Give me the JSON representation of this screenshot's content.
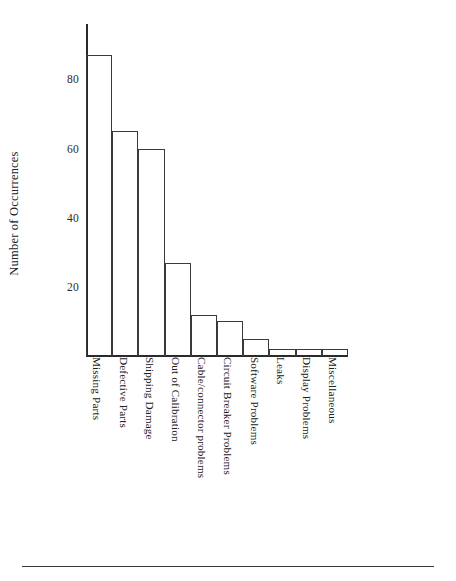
{
  "figure": {
    "top_clipped_text": "",
    "background_color": "#ffffff",
    "line_color": "#3a3a3a"
  },
  "chart_data": {
    "type": "bar",
    "title": "",
    "xlabel": "",
    "ylabel": "Number of Occurrences",
    "ylim": [
      0,
      96
    ],
    "yticks": [
      20,
      40,
      60,
      80
    ],
    "ytick_labels": [
      "20",
      "40",
      "60",
      "80"
    ],
    "grid": false,
    "legend": false,
    "bar_style": "unfilled-outline-adjacent",
    "categories": [
      "Missing Parts",
      "Defective Parts",
      "Shipping Damage",
      "Out of Calibration",
      "Cable/connector problems",
      "Circuit Breaker Problems",
      "Software Problems",
      "Leaks",
      "Display Problems",
      "Miscellaneous"
    ],
    "values": [
      87,
      65,
      60,
      27,
      12,
      10,
      5,
      2,
      2,
      2
    ]
  }
}
